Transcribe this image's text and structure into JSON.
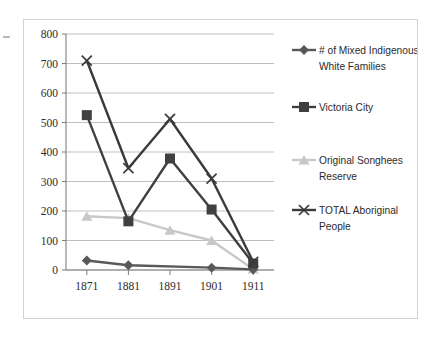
{
  "chart_data": {
    "type": "line",
    "title": "",
    "xlabel": "",
    "ylabel": "",
    "categories": [
      "1871",
      "1881",
      "1891",
      "1901",
      "1911"
    ],
    "ylim": [
      0,
      800
    ],
    "yticks": [
      0,
      100,
      200,
      300,
      400,
      500,
      600,
      700,
      800
    ],
    "ytick_labels": [
      "0",
      "100",
      "200",
      "300",
      "400",
      "500",
      "600",
      "700",
      "800"
    ],
    "grid": true,
    "legend_position": "right",
    "series": [
      {
        "name": "# of Mixed Indigenous-White Families",
        "marker": "diamond",
        "color": "#595959",
        "values": [
          32,
          16,
          null,
          8,
          2
        ]
      },
      {
        "name": "Victoria City",
        "marker": "square",
        "color": "#404040",
        "values": [
          525,
          165,
          378,
          205,
          22
        ]
      },
      {
        "name": "Original Songhees Reserve",
        "marker": "triangle",
        "color": "#c8c8c8",
        "values": [
          182,
          176,
          135,
          100,
          3
        ]
      },
      {
        "name": "TOTAL Aboriginal People",
        "marker": "x",
        "color": "#3a3a3a",
        "values": [
          710,
          345,
          512,
          310,
          28
        ]
      }
    ]
  },
  "legend": {
    "entries": [
      {
        "label_line1": "# of Mixed Indigenous-",
        "label_line2": "White Families",
        "marker": "diamond-marker"
      },
      {
        "label_line1": "Victoria City",
        "label_line2": "",
        "marker": "square-marker"
      },
      {
        "label_line1": "Original Songhees",
        "label_line2": "Reserve",
        "marker": "triangle-marker"
      },
      {
        "label_line1": "TOTAL Aboriginal",
        "label_line2": "People",
        "marker": "x-marker"
      }
    ]
  },
  "colors": {
    "axis": "#7f7f7f",
    "grid": "#bfbfbf",
    "border": "#d2d2d2",
    "text": "#2c2c2c",
    "series_mixed": "#595959",
    "series_victoria": "#404040",
    "series_songhees": "#c8c8c8",
    "series_total": "#3a3a3a"
  }
}
